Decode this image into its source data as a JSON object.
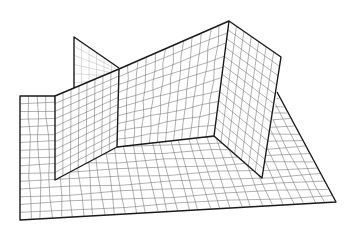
{
  "figure": {
    "colors": {
      "background": "#ffffff",
      "edges": "#1a1a1a",
      "mesh": "#7a7a7a",
      "hidden_mesh": "#b8b8b8"
    },
    "parts": [
      {
        "name": "floor-plate",
        "vertices": [
          [
            20,
            96
          ],
          [
            55,
            96
          ],
          [
            55,
            180
          ],
          [
            117,
            147
          ],
          [
            214,
            136
          ],
          [
            262,
            178
          ],
          [
            282,
            93
          ],
          [
            336,
            202
          ],
          [
            20,
            220
          ]
        ]
      },
      {
        "name": "back-fin",
        "vertices": [
          [
            74,
            37
          ],
          [
            119,
            69
          ],
          [
            74,
            88
          ]
        ]
      },
      {
        "name": "left-wall",
        "vertices": [
          [
            55,
            96
          ],
          [
            119,
            69
          ],
          [
            117,
            147
          ],
          [
            55,
            180
          ]
        ]
      },
      {
        "name": "back-wall",
        "vertices": [
          [
            119,
            69
          ],
          [
            229,
            21
          ],
          [
            214,
            136
          ],
          [
            117,
            147
          ]
        ]
      },
      {
        "name": "right-wall",
        "vertices": [
          [
            229,
            21
          ],
          [
            281,
            57
          ],
          [
            262,
            178
          ],
          [
            214,
            136
          ]
        ]
      }
    ]
  }
}
